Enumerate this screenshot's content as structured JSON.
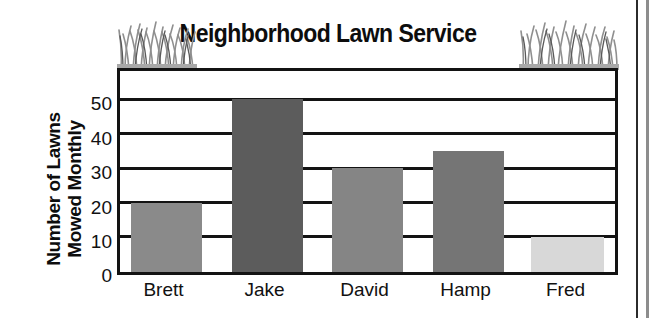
{
  "chart_data": {
    "type": "bar",
    "title": "Neighborhood Lawn Service",
    "xlabel": "",
    "ylabel": "Number of Lawns Mowed Monthly",
    "ylabel_line1": "Number of Lawns",
    "ylabel_line2": "Mowed Monthly",
    "categories": [
      "Brett",
      "Jake",
      "David",
      "Hamp",
      "Fred"
    ],
    "values": [
      20,
      50,
      30,
      35,
      10
    ],
    "bar_colors": [
      "#8a8a8a",
      "#5c5c5c",
      "#858585",
      "#757575",
      "#d8d8d8"
    ],
    "ylim": [
      0,
      58
    ],
    "yticks": [
      0,
      10,
      20,
      30,
      40,
      50
    ],
    "ytick_labels": [
      "0",
      "10",
      "20",
      "30",
      "40",
      "50"
    ],
    "gridlines": [
      10,
      20,
      30,
      40,
      50
    ],
    "grid": true,
    "legend": false,
    "legend_position": "none"
  },
  "decoration": {
    "grass_left": "grass-tuft-icon",
    "grass_right": "grass-tuft-icon"
  }
}
